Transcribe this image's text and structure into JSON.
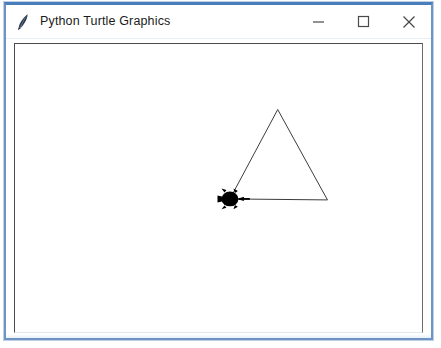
{
  "window": {
    "title": "Python Turtle Graphics",
    "icon": "feather-pen-icon",
    "controls": {
      "minimize": {
        "name": "minimize-button",
        "glyph": "—",
        "tooltip": "Minimize"
      },
      "maximize": {
        "name": "maximize-button",
        "glyph": "□",
        "tooltip": "Maximize"
      },
      "close": {
        "name": "close-button",
        "glyph": "✕",
        "tooltip": "Close"
      }
    },
    "colors": {
      "frame_border": "#6f93c4",
      "frame_border_top": "#4a7ebb",
      "titlebar_background": "#ffffff",
      "title_text": "#1b1b1b",
      "canvas_background": "#ffffff",
      "canvas_border": "#4c4c4c"
    }
  },
  "canvas": {
    "width": 409,
    "height": 290,
    "background": "#ffffff",
    "pen_color": "#3a3a3a",
    "pen_size": 1,
    "turtle": {
      "shape": "turtle",
      "color": "#000000",
      "x": 216,
      "y": 156,
      "heading_degrees": 0,
      "visible": true
    },
    "drawing": {
      "type": "polygon",
      "name": "triangle",
      "sides": 3,
      "closed": false,
      "points": [
        {
          "x": 216,
          "y": 156
        },
        {
          "x": 264,
          "y": 66
        },
        {
          "x": 314,
          "y": 157
        },
        {
          "x": 216,
          "y": 156
        }
      ]
    }
  }
}
